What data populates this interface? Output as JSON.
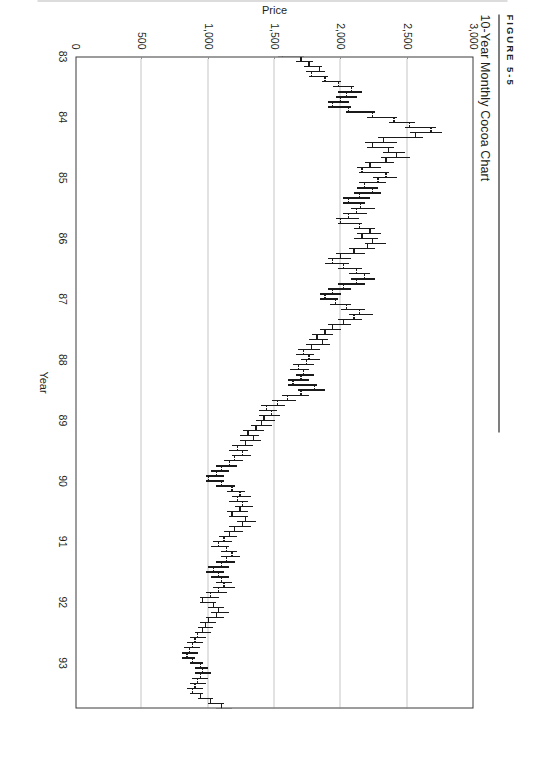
{
  "figure": {
    "number_label": "FIGURE 5-5",
    "title": "10-Year Monthly Cocoa Chart"
  },
  "chart_data": {
    "type": "bar",
    "subtype": "ohlc-high-low-bar",
    "title": "10-Year Monthly Cocoa Chart",
    "xlabel": "Year",
    "ylabel": "Price",
    "grid": true,
    "legend": null,
    "ylim": [
      0,
      3000
    ],
    "ytick_labels": [
      "3,000",
      "2,500",
      "2,000",
      "1,500",
      "1,000",
      "500",
      "0"
    ],
    "ytick_values": [
      3000,
      2500,
      2000,
      1500,
      1000,
      500,
      0
    ],
    "xtick_labels": [
      "83",
      "84",
      "85",
      "86",
      "87",
      "88",
      "89",
      "90",
      "91",
      "92",
      "93"
    ],
    "xtick_values": [
      1983,
      1984,
      1985,
      1986,
      1987,
      1988,
      1989,
      1990,
      1991,
      1992,
      1993
    ],
    "xlim": [
      1983.0,
      1993.75
    ],
    "series_name": "Cocoa monthly price",
    "columns": [
      "date",
      "open",
      "high",
      "low",
      "close"
    ],
    "bars": [
      [
        "1983-01",
        1560,
        1720,
        1530,
        1700
      ],
      [
        "1983-02",
        1700,
        1790,
        1660,
        1760
      ],
      [
        "1983-03",
        1760,
        1860,
        1720,
        1840
      ],
      [
        "1983-04",
        1840,
        1880,
        1740,
        1780
      ],
      [
        "1983-05",
        1780,
        1900,
        1760,
        1880
      ],
      [
        "1983-06",
        1880,
        2000,
        1860,
        1980
      ],
      [
        "1983-07",
        1980,
        2100,
        1940,
        2080
      ],
      [
        "1983-08",
        2080,
        2160,
        1980,
        2040
      ],
      [
        "1983-09",
        2040,
        2120,
        1960,
        2000
      ],
      [
        "1983-10",
        2000,
        2060,
        1900,
        1940
      ],
      [
        "1983-11",
        1940,
        2080,
        1900,
        2060
      ],
      [
        "1983-12",
        2060,
        2260,
        2040,
        2240
      ],
      [
        "1984-01",
        2240,
        2420,
        2200,
        2400
      ],
      [
        "1984-02",
        2400,
        2560,
        2360,
        2520
      ],
      [
        "1984-03",
        2520,
        2720,
        2480,
        2680
      ],
      [
        "1984-04",
        2680,
        2760,
        2520,
        2560
      ],
      [
        "1984-05",
        2560,
        2620,
        2280,
        2320
      ],
      [
        "1984-06",
        2320,
        2420,
        2180,
        2240
      ],
      [
        "1984-07",
        2240,
        2400,
        2200,
        2360
      ],
      [
        "1984-08",
        2360,
        2480,
        2320,
        2420
      ],
      [
        "1984-09",
        2420,
        2520,
        2300,
        2340
      ],
      [
        "1984-10",
        2340,
        2400,
        2180,
        2220
      ],
      [
        "1984-11",
        2220,
        2300,
        2120,
        2160
      ],
      [
        "1984-12",
        2160,
        2360,
        2140,
        2340
      ],
      [
        "1985-01",
        2340,
        2420,
        2240,
        2280
      ],
      [
        "1985-02",
        2280,
        2340,
        2140,
        2180
      ],
      [
        "1985-03",
        2180,
        2280,
        2120,
        2240
      ],
      [
        "1985-04",
        2240,
        2300,
        2100,
        2140
      ],
      [
        "1985-05",
        2140,
        2220,
        2020,
        2060
      ],
      [
        "1985-06",
        2060,
        2180,
        2020,
        2150
      ],
      [
        "1985-07",
        2150,
        2260,
        2080,
        2120
      ],
      [
        "1985-08",
        2120,
        2200,
        2020,
        2060
      ],
      [
        "1985-09",
        2060,
        2140,
        1960,
        2000
      ],
      [
        "1985-10",
        2000,
        2160,
        1980,
        2140
      ],
      [
        "1985-11",
        2140,
        2260,
        2100,
        2220
      ],
      [
        "1985-12",
        2220,
        2300,
        2120,
        2160
      ],
      [
        "1986-01",
        2160,
        2280,
        2100,
        2240
      ],
      [
        "1986-02",
        2240,
        2340,
        2180,
        2200
      ],
      [
        "1986-03",
        2200,
        2260,
        2060,
        2100
      ],
      [
        "1986-04",
        2100,
        2180,
        1960,
        2000
      ],
      [
        "1986-05",
        2000,
        2080,
        1900,
        1940
      ],
      [
        "1986-06",
        1940,
        2060,
        1880,
        2020
      ],
      [
        "1986-07",
        2020,
        2160,
        1980,
        2120
      ],
      [
        "1986-08",
        2120,
        2220,
        2060,
        2180
      ],
      [
        "1986-09",
        2180,
        2260,
        2080,
        2120
      ],
      [
        "1986-10",
        2120,
        2180,
        1980,
        2020
      ],
      [
        "1986-11",
        2020,
        2080,
        1900,
        1940
      ],
      [
        "1986-12",
        1940,
        2000,
        1840,
        1880
      ],
      [
        "1987-01",
        1880,
        1980,
        1840,
        1960
      ],
      [
        "1987-02",
        1960,
        2080,
        1920,
        2040
      ],
      [
        "1987-03",
        2040,
        2180,
        2000,
        2140
      ],
      [
        "1987-04",
        2140,
        2240,
        2060,
        2100
      ],
      [
        "1987-05",
        2100,
        2160,
        1980,
        2020
      ],
      [
        "1987-06",
        2020,
        2080,
        1900,
        1940
      ],
      [
        "1987-07",
        1940,
        2000,
        1840,
        1880
      ],
      [
        "1987-08",
        1880,
        1940,
        1780,
        1820
      ],
      [
        "1987-09",
        1820,
        1900,
        1760,
        1860
      ],
      [
        "1987-10",
        1860,
        1920,
        1740,
        1780
      ],
      [
        "1987-11",
        1780,
        1840,
        1680,
        1720
      ],
      [
        "1987-12",
        1720,
        1800,
        1660,
        1760
      ],
      [
        "1988-01",
        1760,
        1840,
        1700,
        1740
      ],
      [
        "1988-02",
        1740,
        1800,
        1640,
        1680
      ],
      [
        "1988-03",
        1680,
        1760,
        1620,
        1720
      ],
      [
        "1988-04",
        1720,
        1800,
        1660,
        1700
      ],
      [
        "1988-05",
        1700,
        1760,
        1600,
        1640
      ],
      [
        "1988-06",
        1640,
        1820,
        1600,
        1800
      ],
      [
        "1988-07",
        1800,
        1880,
        1680,
        1700
      ],
      [
        "1988-08",
        1700,
        1760,
        1560,
        1600
      ],
      [
        "1988-09",
        1600,
        1660,
        1480,
        1520
      ],
      [
        "1988-10",
        1520,
        1580,
        1400,
        1440
      ],
      [
        "1988-11",
        1440,
        1520,
        1380,
        1480
      ],
      [
        "1988-12",
        1480,
        1540,
        1380,
        1420
      ],
      [
        "1989-01",
        1420,
        1500,
        1360,
        1400
      ],
      [
        "1989-02",
        1400,
        1480,
        1320,
        1360
      ],
      [
        "1989-03",
        1360,
        1420,
        1260,
        1300
      ],
      [
        "1989-04",
        1300,
        1380,
        1240,
        1340
      ],
      [
        "1989-05",
        1340,
        1400,
        1240,
        1280
      ],
      [
        "1989-06",
        1280,
        1340,
        1180,
        1220
      ],
      [
        "1989-07",
        1220,
        1300,
        1160,
        1260
      ],
      [
        "1989-08",
        1260,
        1320,
        1180,
        1200
      ],
      [
        "1989-09",
        1200,
        1260,
        1120,
        1160
      ],
      [
        "1989-10",
        1160,
        1220,
        1060,
        1100
      ],
      [
        "1989-11",
        1100,
        1160,
        1020,
        1060
      ],
      [
        "1989-12",
        1060,
        1120,
        980,
        1000
      ],
      [
        "1990-01",
        1000,
        1120,
        980,
        1100
      ],
      [
        "1990-02",
        1100,
        1200,
        1060,
        1180
      ],
      [
        "1990-03",
        1180,
        1280,
        1140,
        1240
      ],
      [
        "1990-04",
        1240,
        1320,
        1180,
        1220
      ],
      [
        "1990-05",
        1220,
        1300,
        1160,
        1260
      ],
      [
        "1990-06",
        1260,
        1340,
        1200,
        1240
      ],
      [
        "1990-07",
        1240,
        1300,
        1140,
        1180
      ],
      [
        "1990-08",
        1180,
        1300,
        1160,
        1280
      ],
      [
        "1990-09",
        1280,
        1360,
        1220,
        1260
      ],
      [
        "1990-10",
        1260,
        1320,
        1160,
        1200
      ],
      [
        "1990-11",
        1200,
        1260,
        1120,
        1160
      ],
      [
        "1990-12",
        1160,
        1220,
        1080,
        1120
      ],
      [
        "1991-01",
        1120,
        1180,
        1040,
        1080
      ],
      [
        "1991-02",
        1080,
        1160,
        1020,
        1140
      ],
      [
        "1991-03",
        1140,
        1220,
        1100,
        1180
      ],
      [
        "1991-04",
        1180,
        1240,
        1100,
        1140
      ],
      [
        "1991-05",
        1140,
        1200,
        1060,
        1100
      ],
      [
        "1991-06",
        1100,
        1160,
        1000,
        1040
      ],
      [
        "1991-07",
        1040,
        1120,
        980,
        1080
      ],
      [
        "1991-08",
        1080,
        1160,
        1020,
        1100
      ],
      [
        "1991-09",
        1100,
        1180,
        1060,
        1120
      ],
      [
        "1991-10",
        1120,
        1200,
        1040,
        1080
      ],
      [
        "1991-11",
        1080,
        1140,
        980,
        1020
      ],
      [
        "1991-12",
        1020,
        1080,
        940,
        960
      ],
      [
        "1992-01",
        960,
        1060,
        940,
        1040
      ],
      [
        "1992-02",
        1040,
        1120,
        1000,
        1080
      ],
      [
        "1992-03",
        1080,
        1160,
        1020,
        1060
      ],
      [
        "1992-04",
        1060,
        1120,
        980,
        1000
      ],
      [
        "1992-05",
        1000,
        1060,
        940,
        980
      ],
      [
        "1992-06",
        980,
        1040,
        920,
        960
      ],
      [
        "1992-07",
        960,
        1020,
        900,
        920
      ],
      [
        "1992-08",
        920,
        980,
        860,
        900
      ],
      [
        "1992-09",
        900,
        960,
        840,
        880
      ],
      [
        "1992-10",
        880,
        940,
        820,
        860
      ],
      [
        "1992-11",
        860,
        920,
        800,
        840
      ],
      [
        "1992-12",
        840,
        900,
        800,
        880
      ],
      [
        "1993-01",
        880,
        960,
        860,
        940
      ],
      [
        "1993-02",
        940,
        1000,
        900,
        960
      ],
      [
        "1993-03",
        960,
        1020,
        900,
        940
      ],
      [
        "1993-04",
        940,
        1000,
        880,
        920
      ],
      [
        "1993-05",
        920,
        980,
        860,
        900
      ],
      [
        "1993-06",
        900,
        960,
        840,
        880
      ],
      [
        "1993-07",
        880,
        960,
        860,
        940
      ],
      [
        "1993-08",
        940,
        1040,
        920,
        1020
      ],
      [
        "1993-09",
        1020,
        1120,
        1000,
        1100
      ],
      [
        "1993-10",
        1100,
        1180,
        1060,
        1140
      ],
      [
        "1993-11",
        1140,
        1220,
        1100,
        1180
      ]
    ]
  }
}
